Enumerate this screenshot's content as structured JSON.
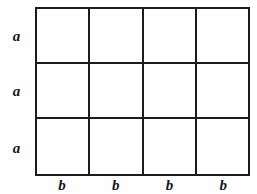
{
  "figure": {
    "type": "geometric-grid-diagram",
    "background_color": "#ffffff",
    "line_color": "#1c1c1c"
  },
  "grid": {
    "columns": 4,
    "rows": 3,
    "cells": [
      [
        "",
        "",
        "",
        ""
      ],
      [
        "",
        "",
        "",
        ""
      ],
      [
        "",
        "",
        "",
        ""
      ]
    ]
  },
  "row_labels": [
    {
      "text": "a"
    },
    {
      "text": "a"
    },
    {
      "text": "a"
    }
  ],
  "column_labels": [
    {
      "text": "b"
    },
    {
      "text": "b"
    },
    {
      "text": "b"
    },
    {
      "text": "b"
    }
  ]
}
